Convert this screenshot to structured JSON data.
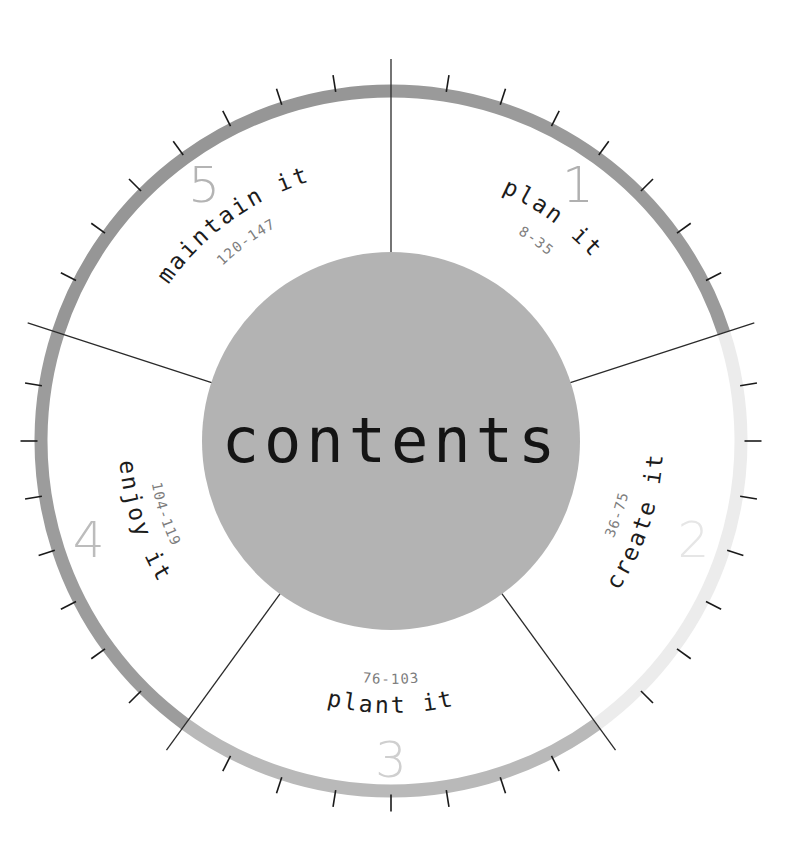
{
  "title": "contents",
  "hub": {
    "label": "contents",
    "color": "#b3b3b3",
    "radius": 189
  },
  "wheel": {
    "center_x": 391,
    "center_y": 441,
    "ring_radius": 350,
    "ring_width": 13,
    "tick_count_per_segment": 8,
    "segment_span_degrees": 72,
    "start_angle_degrees": -90
  },
  "segments": [
    {
      "number": "1",
      "label": "plan it",
      "pages": "8-35",
      "color": "#9a9a9a",
      "number_color": "#b0b0b0",
      "start_deg": -90,
      "end_deg": -18
    },
    {
      "number": "2",
      "label": "create it",
      "pages": "36-75",
      "color": "#ececec",
      "number_color": "#e6e6e6",
      "start_deg": -18,
      "end_deg": 54
    },
    {
      "number": "3",
      "label": "plant it",
      "pages": "76-103",
      "color": "#b9b9b9",
      "number_color": "#cfcfcf",
      "start_deg": 54,
      "end_deg": 126
    },
    {
      "number": "4",
      "label": "enjoy it",
      "pages": "104-119",
      "color": "#9c9c9c",
      "number_color": "#bcbcbc",
      "start_deg": 126,
      "end_deg": 198
    },
    {
      "number": "5",
      "label": "maintain it",
      "pages": "120-147",
      "color": "#969696",
      "number_color": "#b4b4b4",
      "start_deg": 198,
      "end_deg": 270
    }
  ],
  "colors": {
    "tick": "#1a1a1a",
    "divider": "#2a2a2a",
    "page_text": "#7d7d7d",
    "label_text": "#1c1c1c",
    "background": "#ffffff"
  }
}
